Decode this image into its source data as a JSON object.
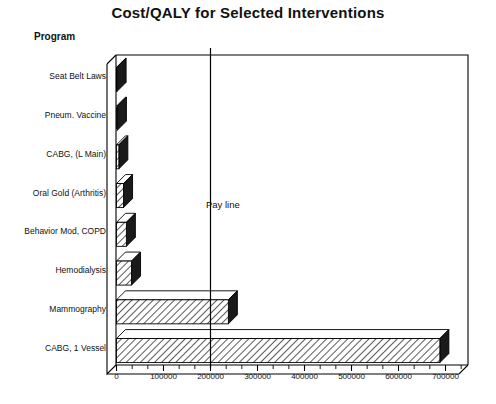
{
  "chart_data": {
    "type": "bar",
    "orientation": "horizontal",
    "title": "Cost/QALY for Selected Interventions",
    "ylabel": "Program",
    "xlabel": "",
    "categories": [
      "Seat Belt Laws",
      "Pneum. Vaccine",
      "CABG, (L Main)",
      "Oral Gold (Arthritis)",
      "Behavior Mod, COPD",
      "Hemodialysis",
      "Mammography",
      "CABG, 1 Vessel"
    ],
    "values": [
      1000,
      2000,
      5000,
      15000,
      21000,
      32000,
      238000,
      688000
    ],
    "xlim": [
      0,
      760000
    ],
    "xticks": [
      0,
      100000,
      200000,
      300000,
      400000,
      500000,
      600000,
      700000
    ],
    "xticklabels": [
      "0",
      "100000",
      "200000",
      "300000",
      "400000",
      "500000",
      "600000",
      "700000"
    ],
    "minor_ticks": true,
    "grid": false,
    "legend": "none",
    "annotations": [
      {
        "name": "pay-line",
        "label": "Pay line",
        "x_value": 200000,
        "type": "vertical-reference-line"
      }
    ],
    "style": {
      "bar_fill": "diagonal-hatch",
      "bar_face_color": "#ffffff",
      "bar_hatch_color": "#000000",
      "bar_side_color": "#1a1a1a",
      "frame_color": "#000000",
      "background": "#ffffff",
      "three_d": true
    }
  }
}
